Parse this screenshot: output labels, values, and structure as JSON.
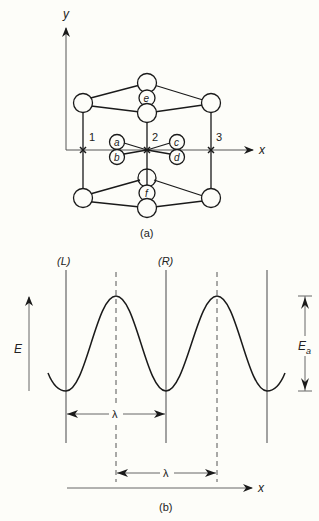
{
  "figure_a": {
    "caption": "(a)",
    "axis_x_label": "x",
    "axis_y_label": "y",
    "site_labels": [
      "1",
      "2",
      "3"
    ],
    "atom_labels": {
      "a": "a",
      "b": "b",
      "c": "c",
      "d": "d",
      "e": "e",
      "f": "f"
    }
  },
  "figure_b": {
    "caption": "(b)",
    "left_plane_label": "(L)",
    "right_plane_label": "(R)",
    "energy_label": "E",
    "activation_label_main": "E",
    "activation_label_sub": "a",
    "wavelength_label_1": "λ",
    "wavelength_label_2": "λ",
    "axis_x_label": "x"
  },
  "colors": {
    "background": "#fdfdf9",
    "stroke": "#1a1a1a",
    "thin_stroke": "#555555"
  }
}
